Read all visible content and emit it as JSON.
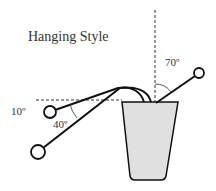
{
  "title": "Hanging Style",
  "angles": {
    "right_stem": "70º",
    "upper_left": "10º",
    "lower_left": "40º"
  },
  "colors": {
    "line": "#111111",
    "pot_fill": "#e0e0e0",
    "text": "#333333"
  }
}
